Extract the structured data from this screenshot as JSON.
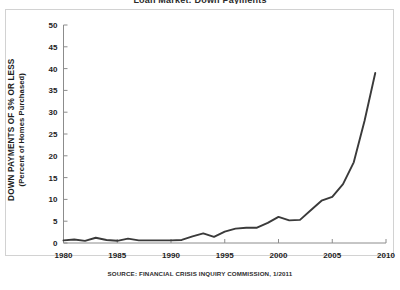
{
  "title_clipped": "Loan Market: Down Payments",
  "source_note": "SOURCE: FINANCIAL CRISIS INQUIRY COMMISSION, 1/2011",
  "axis": {
    "y_title_main": "DOWN PAYMENTS OF 3% OR LESS",
    "y_title_sub": "(Percent of Homes Purchased)"
  },
  "colors": {
    "line": "#3a3a3a",
    "axis": "#8c8c8c",
    "text": "#1d1d1d",
    "frame": "#d2d2d2",
    "background": "#ffffff"
  },
  "chart_data": {
    "type": "line",
    "title": "Loan Market: Down Payments",
    "xlabel": "",
    "ylabel": "DOWN PAYMENTS OF 3% OR LESS (Percent of Homes Purchased)",
    "xlim": [
      1980,
      2010
    ],
    "ylim": [
      0,
      50
    ],
    "ytick_labels": [
      "0",
      "5",
      "10",
      "15",
      "20",
      "25",
      "30",
      "35",
      "40",
      "45",
      "50"
    ],
    "yticks": [
      0,
      5,
      10,
      15,
      20,
      25,
      30,
      35,
      40,
      45,
      50
    ],
    "xtick_labels": [
      "1980",
      "1985",
      "1990",
      "1995",
      "2000",
      "2005",
      "2010"
    ],
    "xticks": [
      1980,
      1985,
      1990,
      1995,
      2000,
      2005,
      2010
    ],
    "grid": false,
    "legend": null,
    "series": [
      {
        "name": "Down payments of 3% or less",
        "x": [
          1980,
          1981,
          1982,
          1983,
          1984,
          1985,
          1986,
          1987,
          1988,
          1989,
          1990,
          1991,
          1992,
          1993,
          1994,
          1995,
          1996,
          1997,
          1998,
          1999,
          2000,
          2001,
          2002,
          2003,
          2004,
          2005,
          2006,
          2007,
          2008,
          2009
        ],
        "values": [
          0.6,
          0.8,
          0.5,
          1.2,
          0.7,
          0.5,
          1.0,
          0.6,
          0.6,
          0.6,
          0.6,
          0.7,
          1.5,
          2.2,
          1.4,
          2.6,
          3.3,
          3.5,
          3.5,
          4.6,
          6.0,
          5.2,
          5.3,
          7.5,
          9.7,
          10.6,
          13.5,
          18.5,
          28.0,
          39.0
        ]
      }
    ]
  }
}
